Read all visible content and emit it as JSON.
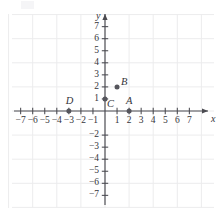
{
  "chart_data": {
    "type": "scatter",
    "title": "",
    "xlabel": "x",
    "ylabel": "y",
    "xlim": [
      -8,
      8
    ],
    "ylim": [
      -8,
      8
    ],
    "grid": true,
    "grid_spacing": 2,
    "grid_color": "#ececed",
    "axis_color": "#4a4a50",
    "point_color": "#55555c",
    "x_ticks": [
      -7,
      -6,
      -5,
      -4,
      -3,
      -2,
      -1,
      1,
      2,
      3,
      4,
      5,
      6,
      7
    ],
    "x_tick_labels": [
      "−7",
      "−6",
      "−5",
      "−4",
      "−3",
      "−2",
      "−1",
      "1",
      "2",
      "3",
      "4",
      "5",
      "6",
      "7"
    ],
    "y_ticks": [
      7,
      6,
      5,
      4,
      3,
      2,
      1,
      -2,
      -3,
      -4,
      -5,
      -6,
      -7
    ],
    "y_tick_labels": [
      "7",
      "6",
      "5",
      "4",
      "3",
      "2",
      "1",
      "−2",
      "−3",
      "−4",
      "−5",
      "−6",
      "−7"
    ],
    "points": [
      {
        "label": "A",
        "x": 2,
        "y": 0,
        "label_dx": 0,
        "label_dy": -10
      },
      {
        "label": "B",
        "x": 1,
        "y": 2,
        "label_dx": 7,
        "label_dy": -5
      },
      {
        "label": "C",
        "x": 0,
        "y": 1,
        "label_dx": 5,
        "label_dy": 5
      },
      {
        "label": "D",
        "x": -3,
        "y": 0,
        "label_dx": 0,
        "label_dy": -10
      }
    ]
  },
  "axes": {
    "x_axis_label": "x",
    "y_axis_label": "y"
  }
}
